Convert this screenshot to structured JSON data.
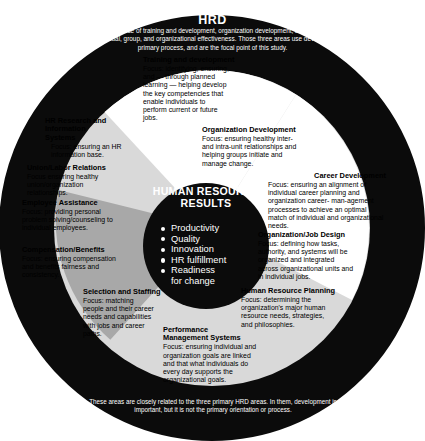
{
  "banner": {
    "title": "HRD",
    "body": "HRD is the integrated use of training and development, organization development, and career development to improve individual, group, and organizational effectiveness. Those three areas use development as their primary process, and are the focal point of this study."
  },
  "footer": {
    "body": "These areas are closely related to the three primary HRD areas. In them, development is important, but it is not the primary orientation or process."
  },
  "core": {
    "title": "HUMAN RESOURCE RESULTS",
    "items": [
      "Productivity",
      "Quality",
      "Innovation",
      "HR fulfillment",
      "Readiness",
      "for change"
    ]
  },
  "segments": [
    {
      "id": "training-and-development",
      "title": "Training and development",
      "body": "Focus: identifying, ensuring, and — through planned learning — helping develop the key competencies that enable individuals to perform current or future jobs."
    },
    {
      "id": "organization-development",
      "title": "Organization Development",
      "body": "Focus: ensuring healthy inter- and intra-unit relationships and helping groups initiate and manage change."
    },
    {
      "id": "career-development",
      "title": "Career Development",
      "body": "Focus: ensuring an alignment of individual career planning and organization career- man-agement processes to achieve an optimal match of individual and organizational needs."
    },
    {
      "id": "hr-research-and-information-systems",
      "title": "HR Research and Information Systems",
      "body": "Focus: ensuring an HR information base."
    },
    {
      "id": "union-labor-relations",
      "title": "Union/Labor Relations",
      "body": "Focus ensuring healthy union/organization relationships."
    },
    {
      "id": "employee-assistance",
      "title": "Employee Assistance",
      "body": "Focus: providing personal problem solving/counseling to individual employees."
    },
    {
      "id": "compensation-benefits",
      "title": "Compensation/Benefits",
      "body": "Focus: ensuring compensation and benefits fairness and consistency."
    },
    {
      "id": "selection-and-staffing",
      "title": "Selection and Staffing",
      "body": "Focus: matching people and their career needs and capabilities with jobs and career paths."
    },
    {
      "id": "performance-management-systems",
      "title": "Performance Management Systems",
      "body": "Focus: ensuring individual and organization goals are linked and that what individuals do every day supports the organizational goals."
    },
    {
      "id": "human-resource-planning",
      "title": "Human Resource Planning",
      "body": "Focus: determining the organization's major human resource needs, strategies, and philosophies."
    },
    {
      "id": "organization-job-design",
      "title": "Organization/Job Design",
      "body": "Focus: defining how tasks, authority, and systems will be organized and integrated across organizational units and in individual jobs."
    }
  ],
  "colors": {
    "black": "#0b0b0b",
    "white": "#ffffff",
    "grey_light": "#d9d9d9",
    "grey_dark": "#a8a8a8",
    "background": "#ffffff"
  }
}
